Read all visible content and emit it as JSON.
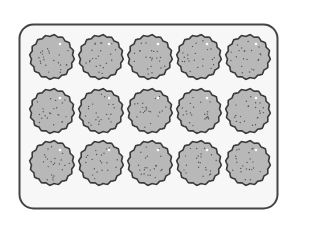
{
  "figure": {
    "rows": 3,
    "columns": 5,
    "total_cookies": 15,
    "colors": {
      "tray_fill": "#f7f7f7",
      "tray_stroke": "#444444",
      "cookie_fill": "#b8b8b8",
      "cookie_stroke": "#3a3a3a",
      "dot": "#555555"
    }
  }
}
